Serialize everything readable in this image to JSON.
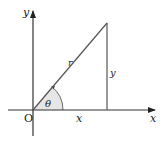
{
  "diagram": {
    "type": "polar-coordinate-triangle",
    "labels": {
      "x_axis": "x",
      "y_axis": "y",
      "origin": "O",
      "hypotenuse": "r",
      "opposite": "y",
      "adjacent": "x",
      "angle": "θ"
    },
    "colors": {
      "line": "#555555",
      "axis": "#333333",
      "angle_fill": "#e6e6e6"
    }
  }
}
